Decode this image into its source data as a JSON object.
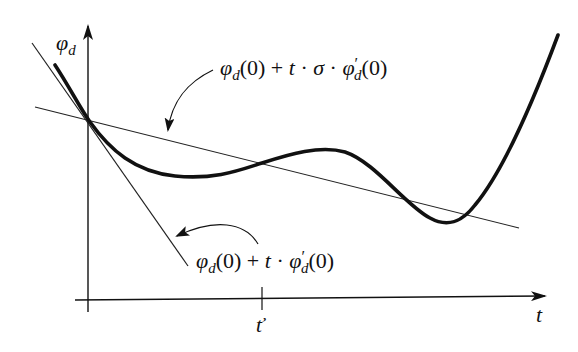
{
  "diagram": {
    "y_axis_label": {
      "base": "φ",
      "sub": "d"
    },
    "x_axis_label": "t",
    "tick_label": "ť",
    "upper_label": {
      "phi": "φ",
      "sub": "d",
      "arg0": "(0)",
      "plus": " + ",
      "t": "t",
      "dot1": " · ",
      "sigma": "σ",
      "dot2": " · ",
      "phi2": "φ",
      "prime": "′",
      "sub2": "d",
      "arg1": "(0)"
    },
    "lower_label": {
      "phi": "φ",
      "sub": "d",
      "arg0": "(0)",
      "plus": " + ",
      "t": "t",
      "dot": " · ",
      "phi2": "φ",
      "prime": "′",
      "sub2": "d",
      "arg1": "(0)"
    },
    "colors": {
      "ink": "#111111",
      "background": "#ffffff"
    }
  }
}
